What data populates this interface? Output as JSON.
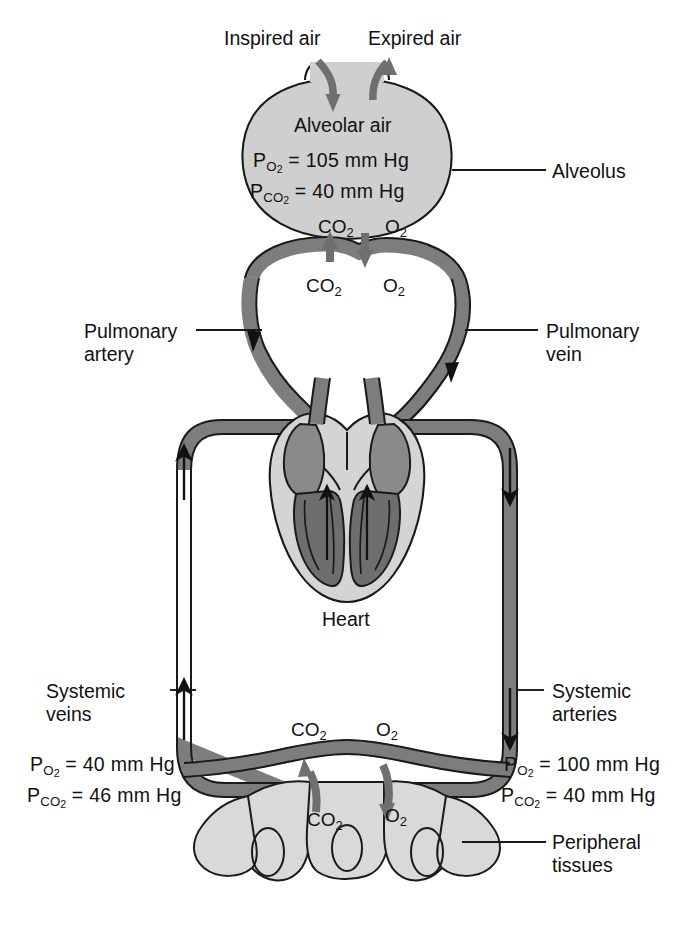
{
  "diagram": {
    "colors": {
      "vessel": "#7d7d7d",
      "vessel_stroke": "#1a1a1a",
      "alveolus_fill": "#cfcfcf",
      "heart_muscle": "#d4d4d4",
      "heart_chamber": "#8a8a8a",
      "heart_chamber_dark": "#6e6e6e",
      "tissue_fill": "#d9d9d9",
      "arrow_gray": "#6f6f6f",
      "text": "#111111",
      "background": "#ffffff"
    }
  },
  "air": {
    "inspired": "Inspired air",
    "expired": "Expired air"
  },
  "alveolus": {
    "title": "Alveolar air",
    "po2_label": "P",
    "po2_sub": "O2",
    "po2_value": "= 105 mm Hg",
    "pco2_label": "P",
    "pco2_sub": "CO2",
    "pco2_value": "= 40 mm Hg",
    "callout": "Alveolus",
    "gas_in_co2": "CO2",
    "gas_in_o2": "O2",
    "gas_blood_co2": "CO2",
    "gas_blood_o2": "O2"
  },
  "pulmonary": {
    "artery_line1": "Pulmonary",
    "artery_line2": "artery",
    "vein_line1": "Pulmonary",
    "vein_line2": "vein"
  },
  "heart": {
    "label": "Heart"
  },
  "systemic": {
    "veins_line1": "Systemic",
    "veins_line2": "veins",
    "arteries_line1": "Systemic",
    "arteries_line2": "arteries"
  },
  "venous_values": {
    "po2_label": "P",
    "po2_sub": "O2",
    "po2_value": "= 40 mm Hg",
    "pco2_label": "P",
    "pco2_sub": "CO2",
    "pco2_value": "= 46 mm Hg"
  },
  "arterial_values": {
    "po2_label": "P",
    "po2_sub": "O2",
    "po2_value": "= 100 mm Hg",
    "pco2_label": "P",
    "pco2_sub": "CO2",
    "pco2_value": "= 40 mm Hg"
  },
  "tissues": {
    "gas_blood_co2": "CO2",
    "gas_blood_o2": "O2",
    "gas_tissue_co2": "CO2",
    "gas_tissue_o2": "O2",
    "callout_line1": "Peripheral",
    "callout_line2": "tissues"
  }
}
